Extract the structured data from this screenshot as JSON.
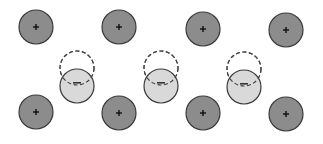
{
  "diagram": {
    "title": "",
    "colors": {
      "background": "#ffffff",
      "positive_fill": "#8c8c8c",
      "negative_fill": "#d6d6d6",
      "stroke": "#3a3a3a",
      "dashed": "#444444"
    },
    "radius": 17,
    "positive_ions": [
      {
        "x": 36,
        "y": 27,
        "label": "+"
      },
      {
        "x": 119,
        "y": 27,
        "label": "+"
      },
      {
        "x": 203,
        "y": 29,
        "label": "+"
      },
      {
        "x": 286,
        "y": 30,
        "label": "+"
      },
      {
        "x": 36,
        "y": 112,
        "label": "+"
      },
      {
        "x": 119,
        "y": 113,
        "label": "+"
      },
      {
        "x": 203,
        "y": 113,
        "label": "+"
      },
      {
        "x": 286,
        "y": 114,
        "label": "+"
      }
    ],
    "negative_clouds": [
      {
        "x": 77,
        "y": 86,
        "label": "−",
        "original_y": 68
      },
      {
        "x": 161,
        "y": 86,
        "label": "−",
        "original_y": 68
      },
      {
        "x": 244,
        "y": 87,
        "label": "−",
        "original_y": 69
      }
    ]
  }
}
